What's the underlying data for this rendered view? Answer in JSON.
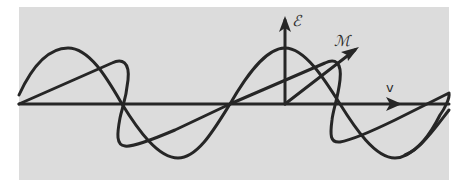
{
  "diagram": {
    "background_color": "#dcdcdc",
    "stroke_color": "#262626",
    "labels": {
      "electric_field": "ℰ",
      "magnetic_field": "ℳ",
      "velocity": "v"
    },
    "components": [
      {
        "name": "electric-field-wave",
        "orientation": "vertical",
        "shape": "sine"
      },
      {
        "name": "magnetic-field-wave",
        "orientation": "oblique (perspective)",
        "shape": "sine"
      },
      {
        "name": "propagation-axis",
        "direction": "right"
      }
    ]
  }
}
